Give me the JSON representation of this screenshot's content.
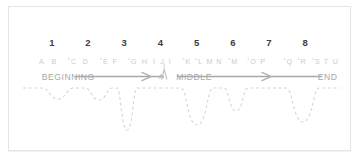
{
  "figure": {
    "background_color": "#ffffff",
    "border_color": "#e3e4e6",
    "number_color": "#3d3d3d",
    "letter_color": "#c9cccf",
    "stage_label_color": "#a6a8ab",
    "axis_color": "#a6a8ab",
    "wave_color": "#d4d6d9"
  },
  "chart_data": {
    "type": "line",
    "xlabel": "",
    "ylabel": "",
    "grid": false,
    "legend": "none",
    "xlim": [
      0,
      8.8
    ],
    "ylim": [
      -4,
      1
    ],
    "numbers": {
      "label": "Act / chapter numbers",
      "values": [
        "1",
        "2",
        "3",
        "4",
        "5",
        "6",
        "7",
        "8"
      ],
      "x": [
        1,
        2,
        3,
        4,
        5,
        6,
        7,
        8
      ]
    },
    "scene_letters": {
      "label": "Scene letters",
      "items": [
        {
          "text": "A",
          "x": 0.72,
          "marked": false
        },
        {
          "text": "B",
          "x": 1.06,
          "marked": false
        },
        {
          "text": "C",
          "x": 1.56,
          "marked": true
        },
        {
          "text": "D",
          "x": 1.93,
          "marked": false
        },
        {
          "text": "E",
          "x": 2.44,
          "marked": true
        },
        {
          "text": "F",
          "x": 2.74,
          "marked": false
        },
        {
          "text": "G",
          "x": 3.22,
          "marked": true
        },
        {
          "text": "H",
          "x": 3.56,
          "marked": false
        },
        {
          "text": "I",
          "x": 3.83,
          "marked": false
        },
        {
          "text": "J",
          "x": 4.05,
          "marked": false
        },
        {
          "text": "I",
          "x": 4.26,
          "marked": false
        },
        {
          "text": "K",
          "x": 4.72,
          "marked": true
        },
        {
          "text": "L",
          "x": 5.06,
          "marked": true
        },
        {
          "text": "M",
          "x": 5.36,
          "marked": false
        },
        {
          "text": "N",
          "x": 5.62,
          "marked": false
        },
        {
          "text": "M",
          "x": 6.0,
          "marked": true
        },
        {
          "text": "O",
          "x": 6.52,
          "marked": true
        },
        {
          "text": "P",
          "x": 6.83,
          "marked": false
        },
        {
          "text": "Q",
          "x": 7.52,
          "marked": true
        },
        {
          "text": "R",
          "x": 7.9,
          "marked": true
        },
        {
          "text": "S",
          "x": 8.3,
          "marked": true
        },
        {
          "text": "T",
          "x": 8.58,
          "marked": false
        },
        {
          "text": "U",
          "x": 8.84,
          "marked": false
        }
      ]
    },
    "stages": [
      {
        "name": "beginning",
        "label": "BEGINNING",
        "x": 0.72
      },
      {
        "name": "middle",
        "label": "MIDDLE",
        "x": 4.93
      },
      {
        "name": "end",
        "label": "END",
        "x": 8.62
      }
    ],
    "apex_marker": {
      "label": "A",
      "x": 4.02
    },
    "arrows": [
      {
        "name": "beginning-to-middle-arrow",
        "x_start": 1.95,
        "x_end": 3.98
      },
      {
        "name": "middle-to-end-arrow",
        "x_start": 5.62,
        "x_end": 8.22
      }
    ],
    "tension_curve": {
      "label": "Tension / event curve",
      "description": "Dashed curve with shallow and deep dips marking story events",
      "baseline_y": 0,
      "dips": [
        {
          "name": "dip-1",
          "center_x": 1.18,
          "depth": 0.55,
          "width": 0.82
        },
        {
          "name": "dip-2",
          "center_x": 2.28,
          "depth": 0.6,
          "width": 0.75
        },
        {
          "name": "dip-3",
          "center_x": 2.98,
          "depth": 3.25,
          "width": 0.52
        },
        {
          "name": "dip-4",
          "center_x": 5.05,
          "depth": 2.55,
          "width": 0.82
        },
        {
          "name": "dip-5",
          "center_x": 6.02,
          "depth": 1.35,
          "width": 0.62
        },
        {
          "name": "dip-6",
          "center_x": 7.65,
          "depth": 2.35,
          "width": 0.9
        }
      ]
    }
  }
}
